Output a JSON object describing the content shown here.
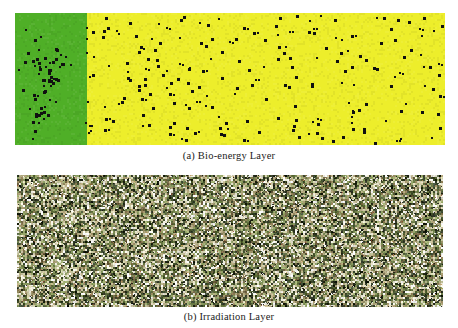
{
  "figure": {
    "panels": [
      {
        "id": "bio-energy-layer",
        "caption": "(a) Bio-energy Layer",
        "label": "(a)",
        "title": "Bio-energy Layer",
        "description": "Two-tone grid: dense green energy region on the left, sparse yellow region filling the remainder, overlaid with scattered black agent markers.",
        "regions": [
          {
            "name": "high-energy-region",
            "color": "#4FAF27",
            "width_fraction": 0.168
          },
          {
            "name": "low-energy-region",
            "color": "#EDEE2B",
            "width_fraction": 0.832
          }
        ],
        "marker": {
          "name": "agent-marker",
          "color": "#101010",
          "shape": "square",
          "size_px": 3
        },
        "marker_counts": {
          "green_region": 62,
          "yellow_region": 208,
          "total": 270
        }
      },
      {
        "id": "irradiation-layer",
        "caption": "(b) Irradiation Layer",
        "label": "(b)",
        "title": "Irradiation Layer",
        "description": "Uniform dense random noise field spanning the full grid; speckles in dark olive, green, tan, cream and white.",
        "noise_palette": [
          "#2a2f1c",
          "#43502a",
          "#6b7a46",
          "#9aa96b",
          "#c8c9a2",
          "#e8e6d2",
          "#ffffff",
          "#8a7a52",
          "#5c6b3a",
          "#b5a87e",
          "#3c4a32",
          "#d8d2b4",
          "#7a8c55",
          "#a8a076",
          "#1e2415",
          "#c2b894",
          "#6e6242",
          "#eae8dc",
          "#4b5838",
          "#94a46a"
        ]
      }
    ],
    "colors": {
      "background": "#ffffff",
      "green_accent": "#4FAF27",
      "yellow_accent": "#EDEE2B",
      "marker_black": "#101010"
    }
  },
  "chart_data": {
    "type": "heatmap",
    "title": "",
    "panels": [
      {
        "type": "heatmap",
        "name": "Bio-energy Layer",
        "caption": "(a) Bio-energy Layer",
        "xlabel": "",
        "ylabel": "",
        "grid": false,
        "legend": "none",
        "categories": [
          "high energy (green)",
          "low energy (yellow)"
        ],
        "values": [
          0.168,
          0.832
        ],
        "series": [
          {
            "name": "high energy cells",
            "values": [
              0.168
            ]
          },
          {
            "name": "low energy cells",
            "values": [
              0.832
            ]
          }
        ],
        "overlay": {
          "name": "agents",
          "marker": "black square",
          "count": 270
        }
      },
      {
        "type": "heatmap",
        "name": "Irradiation Layer",
        "caption": "(b) Irradiation Layer",
        "xlabel": "",
        "ylabel": "",
        "grid": false,
        "legend": "none",
        "categories": [
          "random irradiation intensity"
        ],
        "values": [
          1.0
        ],
        "series": [
          {
            "name": "irradiation intensity",
            "values": [
              1.0
            ]
          }
        ]
      }
    ]
  }
}
